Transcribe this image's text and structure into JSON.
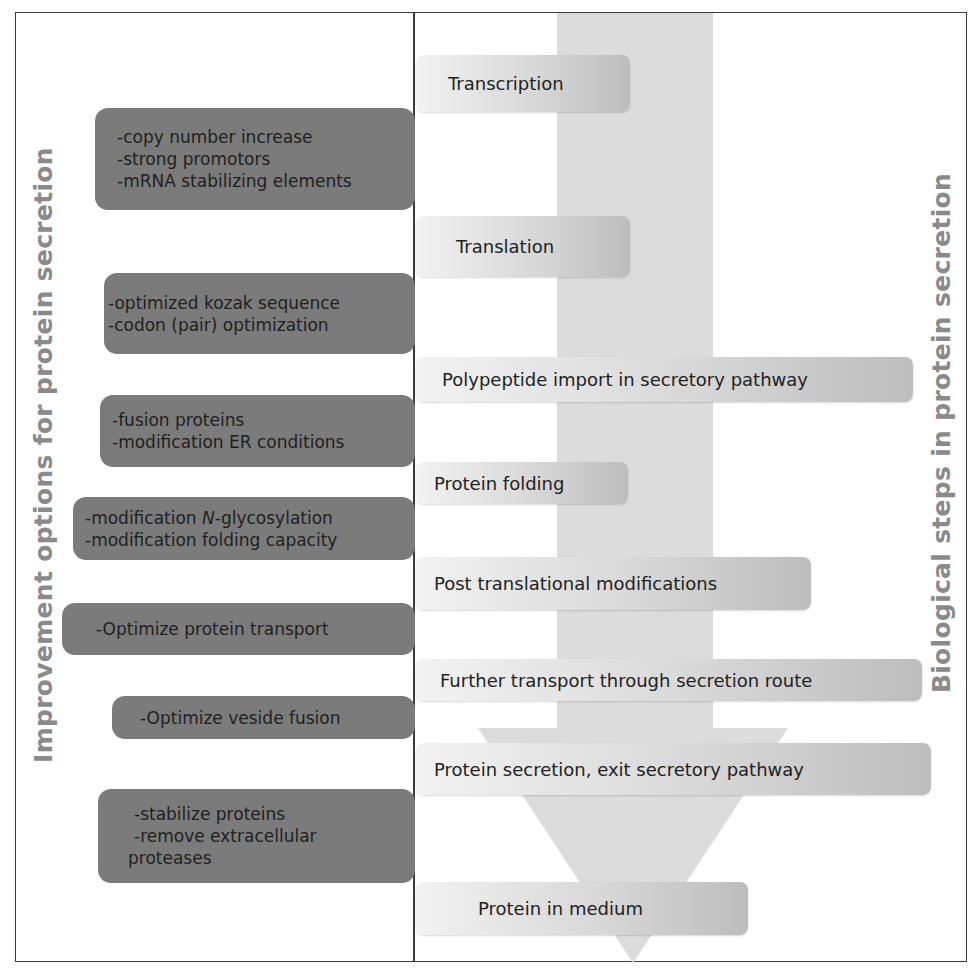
{
  "titles": {
    "left": "Improvement options for protein secretion",
    "right": "Biological steps in protein secretion"
  },
  "colors": {
    "option_box": "#7b7b7b",
    "step_box": "#d8d8d8",
    "arrow": "#dcdcdc",
    "title_text": "#8a8a8a",
    "frame": "#3a3a3a"
  },
  "steps": [
    {
      "label": "Transcription"
    },
    {
      "label": "Translation"
    },
    {
      "label": "Polypeptide import in secretory pathway"
    },
    {
      "label": "Protein folding"
    },
    {
      "label": "Post translational modifications"
    },
    {
      "label": "Further transport through secretion route"
    },
    {
      "label": "Protein secretion, exit secretory pathway"
    },
    {
      "label": "Protein in medium"
    }
  ],
  "options": [
    {
      "lines": [
        "-copy number increase",
        "-strong promotors",
        "-mRNA stabilizing elements"
      ]
    },
    {
      "lines": [
        "-optimized kozak sequence",
        "-codon (pair) optimization"
      ]
    },
    {
      "lines": [
        "-fusion proteins",
        "-modification ER conditions"
      ]
    },
    {
      "lines": [
        "-modification ",
        "N",
        "-glycosylation",
        "-modification folding capacity"
      ]
    },
    {
      "lines": [
        "-Optimize protein transport"
      ]
    },
    {
      "lines": [
        "-Optimize veside fusion"
      ]
    },
    {
      "lines": [
        "-stabilize proteins",
        "-remove extracellular",
        "proteases"
      ]
    }
  ]
}
